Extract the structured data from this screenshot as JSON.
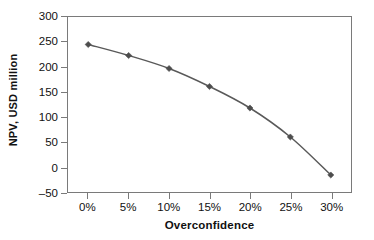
{
  "chart_data": {
    "type": "line",
    "title": "",
    "xlabel": "Overconfidence",
    "ylabel": "NPV, USD million",
    "x": [
      0,
      5,
      10,
      15,
      20,
      25,
      30
    ],
    "xtick_labels": [
      "0%",
      "5%",
      "10%",
      "15%",
      "20%",
      "25%",
      "30%"
    ],
    "ytick_labels": [
      "300",
      "250",
      "200",
      "150",
      "100",
      "50",
      "0",
      "–50"
    ],
    "ytick_values": [
      300,
      250,
      200,
      150,
      100,
      50,
      0,
      -50
    ],
    "ylim": [
      -50,
      300
    ],
    "xlim": [
      -2.5,
      32.5
    ],
    "grid": false,
    "legend": false,
    "marker": "diamond",
    "series": [
      {
        "name": "NPV",
        "values": [
          245,
          223,
          197,
          161,
          118,
          60,
          -16
        ],
        "color": "#595959"
      }
    ]
  },
  "style": {
    "line_color": "#595959",
    "marker_color": "#4d4d4d",
    "axis_color": "#7a7a7a",
    "text_color": "#111111",
    "background": "#ffffff"
  }
}
